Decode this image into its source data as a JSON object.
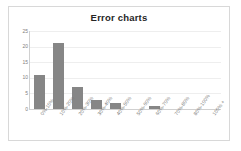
{
  "chart": {
    "title": "Error charts"
  },
  "chart_data": {
    "type": "bar",
    "title": "Error charts",
    "xlabel": "",
    "ylabel": "",
    "categories": [
      "0%-10%",
      "10%-20%",
      "20%-30%",
      "30%-40%",
      "40%-50%",
      "50%-60%",
      "60%-70%",
      "70%-80%",
      "80%-100%",
      "100% +"
    ],
    "values": [
      11,
      21,
      7,
      3,
      2,
      0,
      1,
      0,
      0,
      0
    ],
    "ylim": [
      0,
      25
    ],
    "yticks": [
      0,
      5,
      10,
      15,
      20,
      25
    ],
    "ytick_labels": [
      "0",
      "5",
      "10",
      "15",
      "20",
      "25"
    ],
    "grid": true,
    "legend": false,
    "bar_color": "#868686",
    "gridline_color": "#eeeeee",
    "axis_color": "#d0d0d0",
    "tick_label_color": "#808080",
    "title_color": "#262626",
    "plot_background": "#ffffff",
    "frame_border_color": "#d8d8d8"
  }
}
